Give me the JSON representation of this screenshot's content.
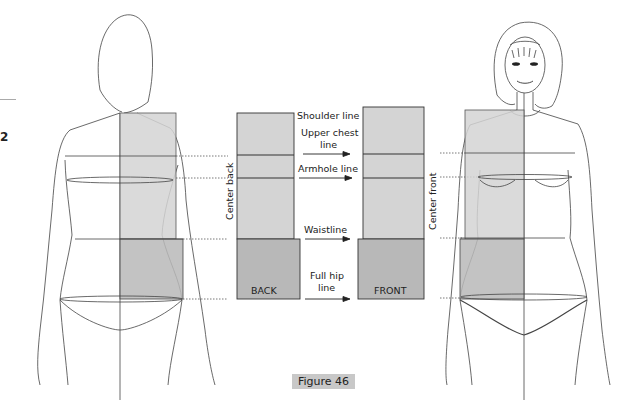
{
  "figure": {
    "caption": "Figure 46",
    "margin_number": "2",
    "blocks": {
      "back_label": "BACK",
      "front_label": "FRONT",
      "center_back": "Center back",
      "center_front": "Center front"
    },
    "lines": [
      {
        "id": "shoulder",
        "text": "Shoulder line"
      },
      {
        "id": "upper_chest_1",
        "text": "Upper chest"
      },
      {
        "id": "upper_chest_2",
        "text": "line"
      },
      {
        "id": "armhole",
        "text": "Armhole line"
      },
      {
        "id": "waist",
        "text": "Waistline"
      },
      {
        "id": "full_hip_1",
        "text": "Full hip"
      },
      {
        "id": "full_hip_2",
        "text": "line"
      }
    ],
    "colors": {
      "light_fill": "#d4d4d4",
      "dark_fill": "#b8b8b8",
      "stroke": "#333333",
      "caption_bg": "#c8c8c8"
    }
  }
}
